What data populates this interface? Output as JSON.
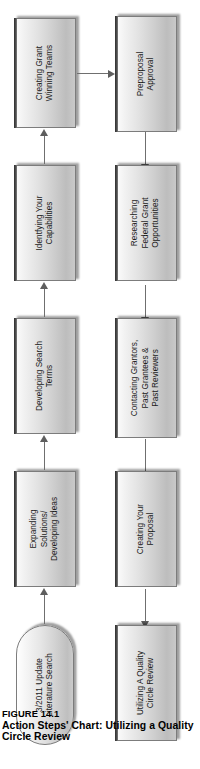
{
  "figure": {
    "number": "FIGURE 14.1",
    "title": "Action Steps' Chart: Utilizing a Quality Circle Review"
  },
  "diagram": {
    "type": "flowchart",
    "orientation": "rotated-90-ccw-on-page",
    "rows": [
      {
        "name": "top-row",
        "flow_direction": "right-to-left (reads bottom-to-top on page)",
        "nodes": [
          {
            "id": "node-literature-search",
            "label": "3/2011 Update\nLiterature Search",
            "shape": "stadium"
          },
          {
            "id": "node-expanding-solutions",
            "label": "Expanding\nSolutions/\nDeveloping Ideas",
            "shape": "rect"
          },
          {
            "id": "node-developing-search-terms",
            "label": "Developing Search\nTerms",
            "shape": "rect"
          },
          {
            "id": "node-identifying-capabilities",
            "label": "Identfying Your\nCapabilities",
            "shape": "rect"
          },
          {
            "id": "node-grant-winning-teams",
            "label": "Creating Grant\nWinning Teams",
            "shape": "rect"
          }
        ]
      },
      {
        "name": "bottom-row",
        "flow_direction": "left-to-right (reads top-to-bottom on page)",
        "nodes": [
          {
            "id": "node-preproposal-approval",
            "label": "Preproposal\nApproval",
            "shape": "rect"
          },
          {
            "id": "node-researching-federal-grants",
            "label": "Researching\nFederal Grant\nOpportunities",
            "shape": "rect"
          },
          {
            "id": "node-contacting-grantors",
            "label": "Contacting Grantors,\nPast Grantees &\nPast Reviewers",
            "shape": "rect"
          },
          {
            "id": "node-creating-proposal",
            "label": "Creating Your\nProposal",
            "shape": "rect"
          },
          {
            "id": "node-quality-circle-review",
            "label": "Utilizing A Quality\nCircle Review",
            "shape": "rect"
          }
        ]
      }
    ],
    "connectors": [
      {
        "id": "connector-literature-to-expanding",
        "from": "node-literature-search",
        "to": "node-expanding-solutions"
      },
      {
        "id": "connector-expanding-to-search-terms",
        "from": "node-expanding-solutions",
        "to": "node-developing-search-terms"
      },
      {
        "id": "connector-search-terms-to-capabilities",
        "from": "node-developing-search-terms",
        "to": "node-identifying-capabilities"
      },
      {
        "id": "connector-capabilities-to-teams",
        "from": "node-identifying-capabilities",
        "to": "node-grant-winning-teams"
      },
      {
        "id": "connector-teams-to-preproposal",
        "from": "node-grant-winning-teams",
        "to": "node-preproposal-approval"
      },
      {
        "id": "connector-preproposal-to-researching",
        "from": "node-preproposal-approval",
        "to": "node-researching-federal-grants"
      },
      {
        "id": "connector-researching-to-contacting",
        "from": "node-researching-federal-grants",
        "to": "node-contacting-grantors"
      },
      {
        "id": "connector-contacting-to-creating",
        "from": "node-contacting-grantors",
        "to": "node-creating-proposal"
      },
      {
        "id": "connector-creating-to-quality-circle",
        "from": "node-creating-proposal",
        "to": "node-quality-circle-review"
      }
    ],
    "colors": {
      "node_fill_light": "#fdfdfd",
      "node_fill_dark": "#bdbdbd",
      "node_border": "#7c7c7c",
      "node_top_lip": "#2e2e2e",
      "connector": "#6f6f6f",
      "text": "#1a1a1a",
      "background": "#ffffff"
    }
  }
}
